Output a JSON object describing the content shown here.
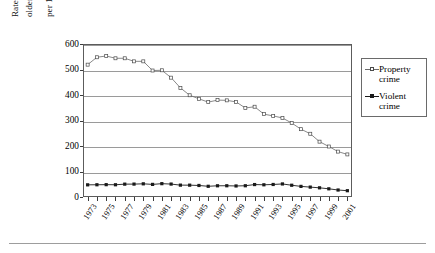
{
  "chart_data": {
    "type": "line",
    "title": "",
    "xlabel": "",
    "ylabel": "Rate (number per 1,000 population age 12 and older) of violent victimizations and rate (number per 1,000 households) of property crimes",
    "ylabel_line1": "Rate (number per 1,000 population age 12 and",
    "ylabel_line2": "older) of violent victimizations and rate (number",
    "ylabel_line3": "per 1,000 households) of property crimes",
    "ylim": [
      0,
      600
    ],
    "yticks": [
      0,
      100,
      200,
      300,
      400,
      500,
      600
    ],
    "ytick_labels": [
      "0",
      "100",
      "200",
      "300",
      "400",
      "500",
      "600"
    ],
    "grid": true,
    "legend_position": "right",
    "x": [
      1973,
      1974,
      1975,
      1976,
      1977,
      1978,
      1979,
      1980,
      1981,
      1982,
      1983,
      1984,
      1985,
      1986,
      1987,
      1988,
      1989,
      1990,
      1991,
      1992,
      1993,
      1994,
      1995,
      1996,
      1997,
      1998,
      1999,
      2000,
      2001
    ],
    "xtick_labels": [
      "1973",
      "1975",
      "1977",
      "1979",
      "1981",
      "1983",
      "1985",
      "1987",
      "1989",
      "1991",
      "1993",
      "1995",
      "1997",
      "1999",
      "2001"
    ],
    "series": [
      {
        "name": "Property crime",
        "color": "#6b6b6b",
        "marker": "open-square",
        "values": [
          519,
          548,
          553,
          544,
          544,
          532,
          532,
          496,
          497,
          468,
          428,
          399,
          385,
          372,
          380,
          379,
          373,
          349,
          354,
          325,
          318,
          310,
          290,
          266,
          248,
          217,
          198,
          178,
          167
        ]
      },
      {
        "name": "Violent crime",
        "color": "#1a1a1a",
        "marker": "filled-square",
        "values": [
          47.7,
          48.0,
          48.4,
          48.0,
          50.4,
          50.6,
          51.7,
          49.4,
          52.3,
          50.7,
          46.5,
          46.4,
          45.2,
          42.0,
          44.0,
          44.1,
          43.3,
          44.1,
          48.8,
          47.9,
          49.1,
          51.2,
          46.1,
          41.6,
          38.8,
          36.0,
          32.1,
          27.4,
          24.7
        ]
      }
    ]
  },
  "legend": {
    "items": [
      {
        "label": "Property\ncrime",
        "color": "#6b6b6b"
      },
      {
        "label": "Violent\ncrime",
        "color": "#1a1a1a"
      }
    ]
  }
}
